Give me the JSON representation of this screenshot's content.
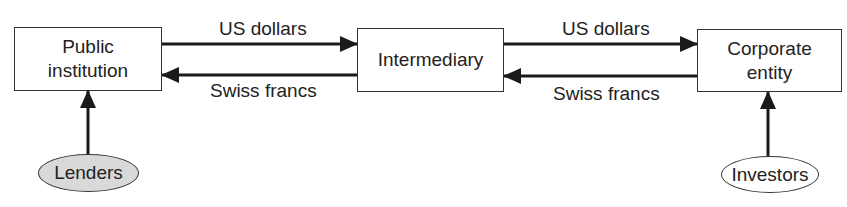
{
  "diagram": {
    "nodes": {
      "public_institution": {
        "line1": "Public",
        "line2": "institution"
      },
      "intermediary": {
        "label": "Intermediary"
      },
      "corporate_entity": {
        "line1": "Corporate",
        "line2": "entity"
      },
      "lenders": {
        "label": "Lenders",
        "fill": "#d9d9d9"
      },
      "investors": {
        "label": "Investors",
        "fill": "#ffffff"
      }
    },
    "edges": {
      "left_top": {
        "label": "US dollars",
        "direction": "public_institution -> intermediary"
      },
      "left_bottom": {
        "label": "Swiss francs",
        "direction": "intermediary -> public_institution"
      },
      "right_top": {
        "label": "US dollars",
        "direction": "intermediary -> corporate_entity"
      },
      "right_bottom": {
        "label": "Swiss francs",
        "direction": "corporate_entity -> intermediary"
      },
      "lenders_up": {
        "direction": "lenders -> public_institution"
      },
      "investors_up": {
        "direction": "investors -> corporate_entity"
      }
    },
    "colors": {
      "stroke": "#1a1a1a",
      "box_border": "#333333",
      "lenders_fill": "#d9d9d9"
    }
  }
}
